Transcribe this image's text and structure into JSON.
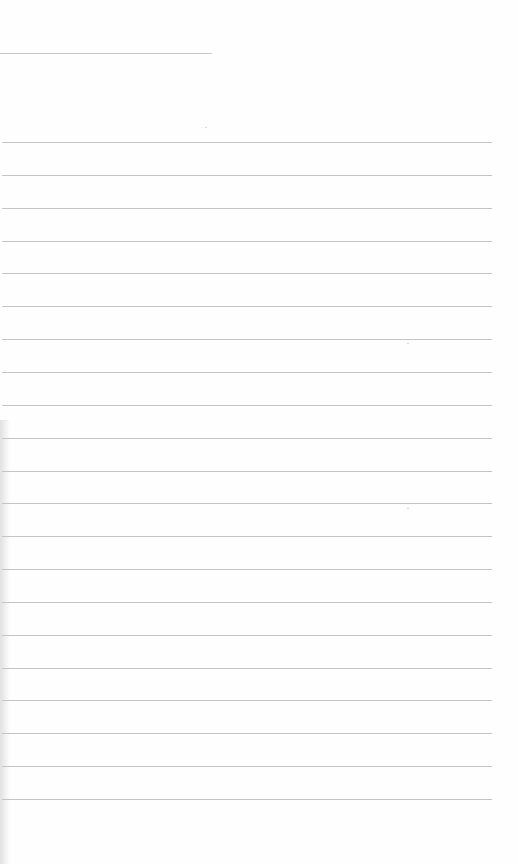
{
  "document": {
    "type": "lined-paper",
    "header_line": {
      "y": 53,
      "x_end": 212
    },
    "rules": {
      "count": 21,
      "first_y": 142,
      "spacing": 32.85,
      "x_start": 2,
      "x_end": 492,
      "color": "#c4c4c4"
    },
    "text": ""
  }
}
